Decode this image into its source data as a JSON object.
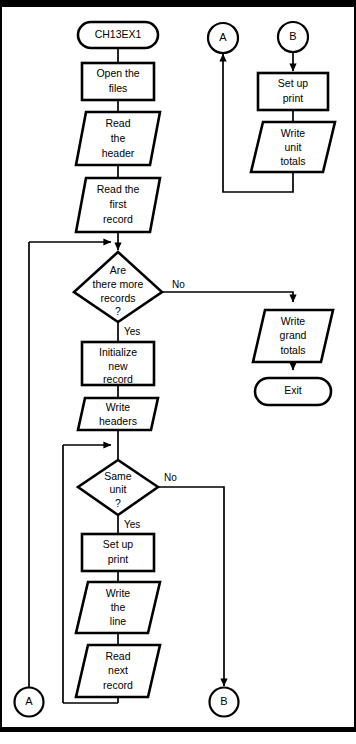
{
  "diagram": {
    "title": "CH13EX1",
    "type": "flowchart",
    "nodes": {
      "start": {
        "label": "CH13EX1",
        "shape": "terminal"
      },
      "open_files": {
        "line1": "Open the",
        "line2": "files",
        "shape": "process"
      },
      "read_header": {
        "line1": "Read",
        "line2": "the",
        "line3": "header",
        "shape": "io"
      },
      "read_first": {
        "line1": "Read the",
        "line2": "first",
        "line3": "record",
        "shape": "io"
      },
      "more_records": {
        "line1": "Are",
        "line2": "there more",
        "line3": "records",
        "line4": "?",
        "shape": "decision"
      },
      "init_record": {
        "line1": "Initialize",
        "line2": "new",
        "line3": "record",
        "shape": "process"
      },
      "write_headers": {
        "line1": "Write",
        "line2": "headers",
        "shape": "io"
      },
      "same_unit": {
        "line1": "Same",
        "line2": "unit",
        "line3": "?",
        "shape": "decision"
      },
      "set_up_print_main": {
        "line1": "Set up",
        "line2": "print",
        "shape": "process"
      },
      "write_line": {
        "line1": "Write",
        "line2": "the",
        "line3": "line",
        "shape": "io"
      },
      "read_next": {
        "line1": "Read",
        "line2": "next",
        "line3": "record",
        "shape": "io"
      },
      "set_up_print_b": {
        "line1": "Set up",
        "line2": "print",
        "shape": "process"
      },
      "write_unit_totals": {
        "line1": "Write",
        "line2": "unit",
        "line3": "totals",
        "shape": "io"
      },
      "write_grand_totals": {
        "line1": "Write",
        "line2": "grand",
        "line3": "totals",
        "shape": "io"
      },
      "exit": {
        "label": "Exit",
        "shape": "terminal"
      }
    },
    "connectors": {
      "a_top": "A",
      "b_top": "B",
      "a_bottom": "A",
      "b_bottom": "B"
    },
    "branch_labels": {
      "more_records_no": "No",
      "more_records_yes": "Yes",
      "same_unit_no": "No",
      "same_unit_yes": "Yes"
    },
    "colors": {
      "stroke": "#000000",
      "fill": "#ffffff",
      "background": "#ffffff"
    }
  }
}
